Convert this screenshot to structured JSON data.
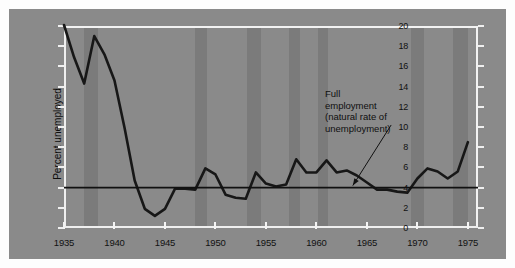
{
  "figure": {
    "background_color": "#8a8a8a",
    "page_color": "#fdfdfd",
    "band_color": "#7b7b7b",
    "line_color": "#171717",
    "axis_color": "#f2f2f2"
  },
  "annotation": {
    "line1": "Full",
    "line2": "employment",
    "line3": "(natural rate of",
    "line4": "unemployment)"
  },
  "axes": {
    "ytitle": "Percent unemployed",
    "yticks": [
      0,
      2,
      4,
      6,
      8,
      10,
      12,
      14,
      16,
      18,
      20
    ],
    "ylim": [
      0,
      20
    ],
    "xticks": [
      1935,
      1940,
      1945,
      1950,
      1955,
      1960,
      1965,
      1970,
      1975
    ],
    "xlim": [
      1935,
      1976
    ],
    "xtitle": ""
  },
  "chart_data": {
    "type": "line",
    "title": "",
    "xlabel": "",
    "ylabel": "Percent unemployed",
    "xlim": [
      1935,
      1976
    ],
    "ylim": [
      0,
      20
    ],
    "grid": false,
    "legend": null,
    "series": [
      {
        "name": "Percent unemployed",
        "x": [
          1935,
          1936,
          1937,
          1938,
          1939,
          1940,
          1941,
          1942,
          1943,
          1944,
          1945,
          1946,
          1947,
          1948,
          1949,
          1950,
          1951,
          1952,
          1953,
          1954,
          1955,
          1956,
          1957,
          1958,
          1959,
          1960,
          1961,
          1962,
          1963,
          1964,
          1965,
          1966,
          1967,
          1968,
          1969,
          1970,
          1971,
          1972,
          1973,
          1974,
          1975
        ],
        "y": [
          20.1,
          16.9,
          14.3,
          19.0,
          17.2,
          14.6,
          9.9,
          4.7,
          1.9,
          1.2,
          1.9,
          3.9,
          3.9,
          3.8,
          5.9,
          5.3,
          3.3,
          3.0,
          2.9,
          5.5,
          4.4,
          4.1,
          4.3,
          6.8,
          5.5,
          5.5,
          6.7,
          5.5,
          5.7,
          5.2,
          4.5,
          3.8,
          3.8,
          3.6,
          3.5,
          4.9,
          5.9,
          5.6,
          4.9,
          5.6,
          8.5
        ]
      }
    ],
    "reference_line": {
      "label": "Full employment (natural rate of unemployment)",
      "value": 4,
      "orientation": "horizontal"
    },
    "shaded_bands": [
      {
        "start": 1937.0,
        "end": 1938.4
      },
      {
        "start": 1948.0,
        "end": 1949.2
      },
      {
        "start": 1953.1,
        "end": 1954.5
      },
      {
        "start": 1957.3,
        "end": 1958.4
      },
      {
        "start": 1960.2,
        "end": 1961.1
      },
      {
        "start": 1969.4,
        "end": 1970.7
      },
      {
        "start": 1973.5,
        "end": 1975.0
      }
    ]
  }
}
